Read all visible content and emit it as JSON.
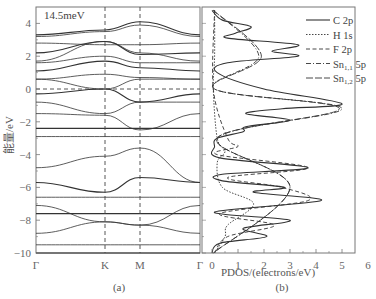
{
  "chart_data": [
    {
      "type": "line",
      "panel_label": "(a)",
      "title": "",
      "annotation": "14.5meV",
      "xlabel": "",
      "ylabel": "能量/eV",
      "x_ticks": [
        "Γ",
        "K",
        "M",
        "Γ"
      ],
      "y_ticks": [
        "4",
        "2",
        "0",
        "−2",
        "−4",
        "−6",
        "−8",
        "−10"
      ],
      "y_tick_values": [
        4,
        2,
        0,
        -2,
        -4,
        -6,
        -8,
        -10
      ],
      "ylim": [
        -10.2,
        4.9
      ],
      "fermi_level": 0,
      "grid": false,
      "description": "Electronic band structure along Γ–K–M–Γ with dashed vertical lines at K and M and dashed horizontal Fermi line at 0 eV",
      "series": [
        {
          "name": "band",
          "values": [
            3.3,
            3.6,
            4.1,
            3.3
          ]
        },
        {
          "name": "band",
          "values": [
            3.2,
            3.5,
            3.9,
            3.2
          ]
        },
        {
          "name": "band",
          "values": [
            2.8,
            2.7,
            2.7,
            2.8
          ]
        },
        {
          "name": "band",
          "values": [
            2.2,
            2.9,
            2.1,
            2.2
          ]
        },
        {
          "name": "band",
          "values": [
            1.7,
            2.9,
            2.2,
            1.7
          ]
        },
        {
          "name": "band",
          "values": [
            1.6,
            2.0,
            1.6,
            1.6
          ]
        },
        {
          "name": "band",
          "values": [
            1.1,
            1.7,
            1.3,
            1.1
          ]
        },
        {
          "name": "band",
          "values": [
            0.6,
            0.9,
            0.7,
            0.6
          ]
        },
        {
          "name": "band",
          "values": [
            0.6,
            0.0,
            0.6,
            0.6
          ]
        },
        {
          "name": "band",
          "values": [
            -0.3,
            0.0,
            -0.8,
            -0.3
          ]
        },
        {
          "name": "band",
          "values": [
            -0.8,
            -1.5,
            -0.8,
            -0.8
          ]
        },
        {
          "name": "band",
          "values": [
            -1.5,
            -1.6,
            -2.5,
            -1.5
          ]
        },
        {
          "name": "band",
          "values": [
            -2.4,
            -2.4,
            -2.4,
            -2.4
          ]
        },
        {
          "name": "band",
          "values": [
            -2.9,
            -2.9,
            -2.9,
            -2.9
          ]
        },
        {
          "name": "band",
          "values": [
            -4.8,
            -4.1,
            -3.6,
            -5.7
          ]
        },
        {
          "name": "band",
          "values": [
            -5.7,
            -6.3,
            -5.4,
            -5.7
          ]
        },
        {
          "name": "band",
          "values": [
            -6.6,
            -6.6,
            -6.6,
            -6.6
          ]
        },
        {
          "name": "band",
          "values": [
            -7.1,
            -8.1,
            -8.3,
            -7.1
          ]
        },
        {
          "name": "band",
          "values": [
            -7.6,
            -7.6,
            -7.6,
            -7.6
          ]
        },
        {
          "name": "band",
          "values": [
            -8.8,
            -8.1,
            -8.3,
            -8.8
          ]
        },
        {
          "name": "band",
          "values": [
            -9.5,
            -9.5,
            -9.5,
            -9.5
          ]
        },
        {
          "name": "band",
          "values": [
            -10.0,
            -10.0,
            -10.0,
            -10.0
          ]
        }
      ]
    },
    {
      "type": "line",
      "panel_label": "(b)",
      "title": "",
      "xlabel": "PDOS/(electrons/eV)",
      "ylabel": "",
      "x_ticks": [
        "0",
        "1",
        "2",
        "3",
        "4",
        "5",
        "6"
      ],
      "xlim": [
        -0.4,
        6
      ],
      "shared_y_with": "(a)",
      "legend_position": "upper right",
      "legend": [
        "C 2p",
        "H 1s",
        "F 2p",
        "Sn1,1 5p",
        "Sn1,2 5p"
      ],
      "grid": false,
      "series": [
        {
          "name": "C 2p",
          "style": "solid",
          "energy": [
            4.8,
            4.2,
            3.8,
            3.4,
            3.1,
            2.7,
            2.3,
            2.0,
            1.6,
            1.0,
            0.0,
            -0.9,
            -1.2,
            -1.5,
            -1.9,
            -2.3,
            -2.6,
            -3.0,
            -3.5,
            -4.2,
            -4.8,
            -5.2,
            -5.6,
            -6.0,
            -6.3,
            -6.8,
            -7.5,
            -8.0,
            -8.5,
            -9.0,
            -9.4,
            -10.0
          ],
          "pdos": [
            0.0,
            0.4,
            1.5,
            0.9,
            0.6,
            3.3,
            2.3,
            3.3,
            0.6,
            0.2,
            2.0,
            5.0,
            2.7,
            1.3,
            3.0,
            1.3,
            1.2,
            0.2,
            0.1,
            0.3,
            3.7,
            0.4,
            0.4,
            2.8,
            1.6,
            4.2,
            0.1,
            3.0,
            1.2,
            2.1,
            0.3,
            0.0
          ]
        },
        {
          "name": "H 1s",
          "style": "dotted",
          "energy": [
            4.8,
            2.0,
            0.0,
            -3.0,
            -3.8,
            -4.5,
            -6.0,
            -7.0,
            -8.3,
            -9.0,
            -10.0
          ],
          "pdos": [
            0.1,
            0.1,
            0.05,
            0.2,
            0.5,
            0.2,
            0.4,
            1.6,
            0.6,
            0.5,
            0.1
          ]
        },
        {
          "name": "F 2p",
          "style": "dashed",
          "energy": [
            4.8,
            0.0,
            -3.0,
            -3.5,
            -4.0,
            -4.8,
            -5.4,
            -6.0,
            -6.8,
            -7.6,
            -8.3,
            -9.0,
            -10.0
          ],
          "pdos": [
            0.1,
            0.05,
            0.6,
            1.0,
            0.2,
            3.7,
            0.6,
            2.7,
            3.7,
            0.3,
            2.4,
            0.6,
            0.1
          ]
        },
        {
          "name": "Sn1,1 5p",
          "style": "dash-dot",
          "energy": [
            4.8,
            2.0,
            0.0,
            -1.2,
            -3.0,
            -6.0,
            -10.0
          ],
          "pdos": [
            0.05,
            1.8,
            0.1,
            5.0,
            0.2,
            3.0,
            0.05
          ]
        },
        {
          "name": "Sn1,2 5p",
          "style": "long-dash",
          "energy": [
            4.8,
            2.0,
            0.0,
            -1.2,
            -3.0,
            -6.0,
            -10.0
          ],
          "pdos": [
            0.05,
            1.9,
            0.1,
            4.9,
            0.2,
            3.0,
            0.05
          ]
        }
      ]
    }
  ],
  "panel_a": {
    "label": "(a)",
    "annotation": "14.5meV",
    "ylabel": "能量/eV",
    "yticks": [
      "4",
      "2",
      "0",
      "−2",
      "−4",
      "−6",
      "−8",
      "−10"
    ],
    "xticks": [
      "Γ",
      "K",
      "M",
      "Γ"
    ]
  },
  "panel_b": {
    "label": "(b)",
    "xlabel": "PDOS/(electrons/eV)",
    "xticks": [
      "0",
      "1",
      "2",
      "3",
      "4",
      "5",
      "6"
    ],
    "legend": [
      {
        "name": "C 2p",
        "sub": "",
        "suffix": ""
      },
      {
        "name": "H 1s",
        "sub": "",
        "suffix": ""
      },
      {
        "name": "F 2p",
        "sub": "",
        "suffix": ""
      },
      {
        "name": "Sn",
        "sub": "1,1",
        "suffix": " 5p"
      },
      {
        "name": "Sn",
        "sub": "1,2",
        "suffix": " 5p"
      }
    ]
  },
  "colors": {
    "line": "#333333",
    "frame": "#777777",
    "text": "#555555"
  }
}
